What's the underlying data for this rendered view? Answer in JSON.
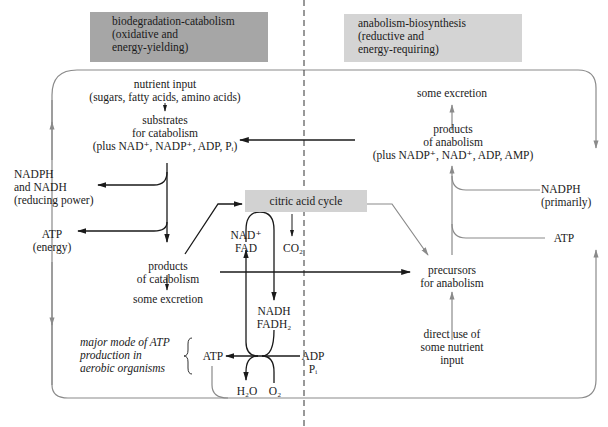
{
  "headers": {
    "catabolism": [
      "biodegradation-catabolism",
      "(oxidative and",
      "energy-yielding)"
    ],
    "anabolism": [
      "anabolism-biosynthesis",
      "(reductive and",
      "energy-requiring)"
    ]
  },
  "catabolism_side": {
    "nutrient_input": [
      "nutrient input",
      "(sugars, fatty acids, amino acids)"
    ],
    "substrates": [
      "substrates",
      "for catabolism",
      "(plus NAD⁺, NADP⁺, ADP, Pᵢ)"
    ],
    "reducing_power": [
      "NADPH",
      "and NADH",
      "(reducing power)"
    ],
    "atp_energy": [
      "ATP",
      "(energy)"
    ],
    "products": [
      "products",
      "of catabolism"
    ],
    "excretion": "some excretion",
    "atp_note": [
      "major mode of ATP",
      "production in",
      "aerobic organisms"
    ]
  },
  "citric_acid_cycle": {
    "label": "citric acid cycle",
    "inputs": [
      "NAD⁺",
      "FAD"
    ],
    "co2": "CO₂",
    "outputs": [
      "NADH",
      "FADH₂"
    ]
  },
  "oxidative_phosphorylation": {
    "atp": "ATP",
    "adp": "ADP",
    "pi": "Pᵢ",
    "h2o": "H₂O",
    "o2": "O₂"
  },
  "anabolism_side": {
    "excretion": "some excretion",
    "products": [
      "products",
      "of anabolism",
      "(plus NADP⁺, NAD⁺, ADP, AMP)"
    ],
    "nadph": [
      "NADPH",
      "(primarily)"
    ],
    "atp": "ATP",
    "precursors": [
      "precursors",
      "for anabolism"
    ],
    "direct_use": [
      "direct use of",
      "some nutrient",
      "input"
    ]
  },
  "colors": {
    "catabolism_header": "#a6a6a6",
    "anabolism_header": "#d4d4d4",
    "citric_acid_cycle_box": "#d2d2d2",
    "dark_arrow": "#1a1a1a",
    "light_arrow": "#8a8a8a"
  }
}
